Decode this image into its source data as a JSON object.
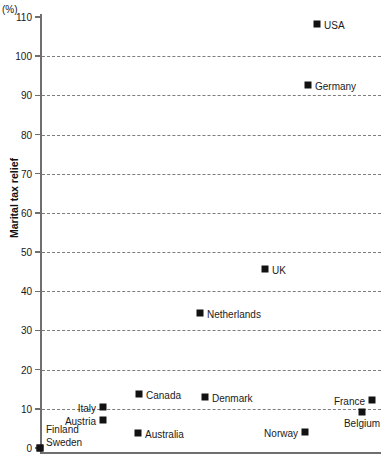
{
  "chart_data": {
    "type": "scatter",
    "title": "",
    "subtitle": "",
    "unit_label": "(%)",
    "ylabel": "Marital tax relief",
    "xlabel": "",
    "ylim": [
      0,
      110
    ],
    "yticks": [
      0,
      10,
      20,
      30,
      40,
      50,
      60,
      70,
      80,
      90,
      100,
      110
    ],
    "ytick_labels": [
      "0",
      "10",
      "20",
      "30",
      "40",
      "50",
      "60",
      "70",
      "80",
      "90",
      "100",
      "110"
    ],
    "grid": "horizontal-dashed",
    "xaxis_ticks": [],
    "legend": "none",
    "categories": [
      "Finland",
      "Sweden",
      "Australia",
      "Norway",
      "Austria",
      "Belgium",
      "Italy",
      "France",
      "Denmark",
      "Canada",
      "Netherlands",
      "UK",
      "Germany",
      "USA"
    ],
    "values": [
      0,
      0,
      4,
      4,
      7,
      9,
      10.5,
      12,
      13,
      13.7,
      34.5,
      45.5,
      92.5,
      108
    ],
    "points": [
      {
        "name": "Finland",
        "value": 0,
        "x_px": 40,
        "y_px": 448,
        "label_pos": "above-left-stack"
      },
      {
        "name": "Sweden",
        "value": 0,
        "x_px": 40,
        "y_px": 448,
        "label_pos": "right-stack"
      },
      {
        "name": "Australia",
        "value": 4,
        "x_px": 138,
        "y_px": 433,
        "label_pos": "right"
      },
      {
        "name": "Norway",
        "value": 4,
        "x_px": 305,
        "y_px": 432,
        "label_pos": "left"
      },
      {
        "name": "Austria",
        "value": 7,
        "x_px": 103,
        "y_px": 420,
        "label_pos": "left"
      },
      {
        "name": "Belgium",
        "value": 9,
        "x_px": 362,
        "y_px": 412,
        "label_pos": "below"
      },
      {
        "name": "Italy",
        "value": 10.5,
        "x_px": 103,
        "y_px": 407,
        "label_pos": "left"
      },
      {
        "name": "France",
        "value": 12,
        "x_px": 372,
        "y_px": 400,
        "label_pos": "left"
      },
      {
        "name": "Denmark",
        "value": 13,
        "x_px": 205,
        "y_px": 397,
        "label_pos": "right"
      },
      {
        "name": "Canada",
        "value": 13.7,
        "x_px": 139,
        "y_px": 394,
        "label_pos": "right"
      },
      {
        "name": "Netherlands",
        "value": 34.5,
        "x_px": 200,
        "y_px": 313,
        "label_pos": "right"
      },
      {
        "name": "UK",
        "value": 45.5,
        "x_px": 265,
        "y_px": 269,
        "label_pos": "right"
      },
      {
        "name": "Germany",
        "value": 92.5,
        "x_px": 308,
        "y_px": 85,
        "label_pos": "right"
      },
      {
        "name": "USA",
        "value": 108,
        "x_px": 317,
        "y_px": 24,
        "label_pos": "right"
      }
    ],
    "colors": {
      "marker": "#121212",
      "axis": "#6f6f6f",
      "gridline": "#7d7d7d",
      "text": "#1a1a1a",
      "background": "#ffffff"
    }
  }
}
